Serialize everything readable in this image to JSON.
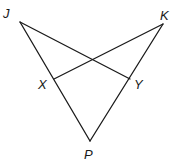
{
  "diagram": {
    "type": "geometry",
    "background": "#ffffff",
    "stroke_color": "#1a1a1a",
    "points": {
      "J": {
        "label": "J",
        "x": 20,
        "y": 22,
        "lx": 3,
        "ly": 18
      },
      "K": {
        "label": "K",
        "x": 163,
        "y": 24,
        "lx": 160,
        "ly": 20
      },
      "X": {
        "label": "X",
        "x": 54,
        "y": 79,
        "lx": 38,
        "ly": 89
      },
      "Y": {
        "label": "Y",
        "x": 130,
        "y": 79,
        "lx": 134,
        "ly": 89
      },
      "P": {
        "label": "P",
        "x": 90,
        "y": 141,
        "lx": 84,
        "ly": 159
      }
    },
    "segments": [
      {
        "from": "J",
        "to": "P"
      },
      {
        "from": "K",
        "to": "P"
      },
      {
        "from": "J",
        "to": "Y"
      },
      {
        "from": "K",
        "to": "X"
      }
    ]
  }
}
